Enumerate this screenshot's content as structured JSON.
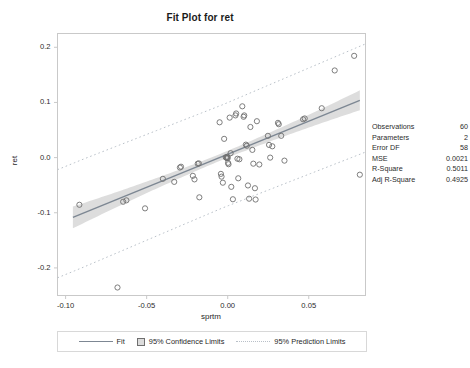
{
  "chart_data": {
    "type": "scatter",
    "title": "Fit Plot for ret",
    "xlabel": "sprtm",
    "ylabel": "ret",
    "xlim": [
      -0.105,
      0.085
    ],
    "ylim": [
      -0.25,
      0.225
    ],
    "xticks": [
      -0.1,
      -0.05,
      0.0,
      0.05
    ],
    "xticklabels": [
      "-0.10",
      "-0.05",
      "0.00",
      "0.05"
    ],
    "yticks": [
      0.2,
      0.1,
      0.0,
      -0.1,
      -0.2
    ],
    "yticklabels": [
      "0.2",
      "0.1",
      "0.0",
      "-0.1",
      "-0.2"
    ],
    "grid": false,
    "legend_position": "bottom",
    "fit": {
      "intercept": 0.0061,
      "slope": 1.2,
      "x_start": -0.0955,
      "x_end": 0.0815
    },
    "confidence_band": {
      "level": 0.95,
      "half_width_center": 0.0062,
      "half_width_edge": 0.0205,
      "x_center": -0.0035
    },
    "prediction_band": {
      "level": 0.95,
      "half_width_center": 0.0935,
      "half_width_edge": 0.098,
      "x_center": -0.0035
    },
    "points": [
      {
        "x": -0.0915,
        "y": -0.0855
      },
      {
        "x": -0.068,
        "y": -0.2355
      },
      {
        "x": -0.0645,
        "y": -0.08
      },
      {
        "x": -0.0625,
        "y": -0.0775
      },
      {
        "x": -0.051,
        "y": -0.092
      },
      {
        "x": -0.04,
        "y": -0.0385
      },
      {
        "x": -0.033,
        "y": -0.044
      },
      {
        "x": -0.0295,
        "y": -0.018
      },
      {
        "x": -0.0288,
        "y": -0.0165
      },
      {
        "x": -0.0215,
        "y": -0.033
      },
      {
        "x": -0.0205,
        "y": -0.0395
      },
      {
        "x": -0.0185,
        "y": -0.011
      },
      {
        "x": -0.0178,
        "y": -0.0105
      },
      {
        "x": -0.0175,
        "y": -0.072
      },
      {
        "x": -0.005,
        "y": 0.064
      },
      {
        "x": -0.0042,
        "y": -0.0295
      },
      {
        "x": -0.0038,
        "y": -0.0345
      },
      {
        "x": -0.003,
        "y": -0.0455
      },
      {
        "x": -0.0022,
        "y": 0.034
      },
      {
        "x": -0.0012,
        "y": 0.0005
      },
      {
        "x": -0.0008,
        "y": 0.0
      },
      {
        "x": -0.0005,
        "y": -0.001
      },
      {
        "x": -0.0002,
        "y": 0.0015
      },
      {
        "x": 0.0,
        "y": -0.0008
      },
      {
        "x": 0.0002,
        "y": -0.0095
      },
      {
        "x": 0.0005,
        "y": -0.012
      },
      {
        "x": 0.0012,
        "y": 0.0725
      },
      {
        "x": 0.0018,
        "y": 0.008
      },
      {
        "x": 0.0022,
        "y": -0.053
      },
      {
        "x": 0.0032,
        "y": -0.0755
      },
      {
        "x": 0.0048,
        "y": 0.0765
      },
      {
        "x": 0.0052,
        "y": 0.08
      },
      {
        "x": 0.006,
        "y": -0.002
      },
      {
        "x": 0.0065,
        "y": -0.0375
      },
      {
        "x": 0.0072,
        "y": -0.003
      },
      {
        "x": 0.009,
        "y": 0.093
      },
      {
        "x": 0.0098,
        "y": 0.074
      },
      {
        "x": 0.0102,
        "y": 0.0765
      },
      {
        "x": 0.0112,
        "y": 0.0235
      },
      {
        "x": 0.0118,
        "y": 0.0215
      },
      {
        "x": 0.0125,
        "y": -0.0505
      },
      {
        "x": 0.0132,
        "y": -0.0745
      },
      {
        "x": 0.014,
        "y": 0.0555
      },
      {
        "x": 0.0152,
        "y": 0.014
      },
      {
        "x": 0.0158,
        "y": -0.011
      },
      {
        "x": 0.0168,
        "y": -0.0555
      },
      {
        "x": 0.0172,
        "y": -0.076
      },
      {
        "x": 0.018,
        "y": 0.066
      },
      {
        "x": 0.0195,
        "y": -0.0125
      },
      {
        "x": 0.0248,
        "y": 0.0395
      },
      {
        "x": 0.0255,
        "y": 0.023
      },
      {
        "x": 0.0262,
        "y": 0.0
      },
      {
        "x": 0.0275,
        "y": 0.0205
      },
      {
        "x": 0.031,
        "y": 0.063
      },
      {
        "x": 0.0315,
        "y": 0.0605
      },
      {
        "x": 0.033,
        "y": 0.0395
      },
      {
        "x": 0.035,
        "y": -0.0055
      },
      {
        "x": 0.0465,
        "y": 0.0695
      },
      {
        "x": 0.0475,
        "y": 0.071
      },
      {
        "x": 0.058,
        "y": 0.0895
      },
      {
        "x": 0.066,
        "y": 0.158
      },
      {
        "x": 0.078,
        "y": 0.1845
      },
      {
        "x": 0.0815,
        "y": -0.031
      }
    ]
  },
  "stats": {
    "rows": [
      {
        "label": "Observations",
        "value": "60"
      },
      {
        "label": "Parameters",
        "value": "2"
      },
      {
        "label": "Error DF",
        "value": "58"
      },
      {
        "label": "MSE",
        "value": "0.0021"
      },
      {
        "label": "R-Square",
        "value": "0.5011"
      },
      {
        "label": "Adj R-Square",
        "value": "0.4925"
      }
    ]
  },
  "legend": {
    "fit_label": "Fit",
    "confidence_label": "95% Confidence Limits",
    "prediction_label": "95% Prediction Limits"
  },
  "colors": {
    "fit_line": "#7d8793",
    "confidence_band": "#d7d7d7",
    "prediction_line": "#b9c0c8",
    "marker_edge": "#6f6f6f",
    "frame": "#c9c9c9",
    "text": "#1f1f1f"
  }
}
